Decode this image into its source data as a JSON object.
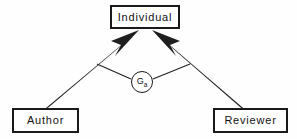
{
  "diagram": {
    "background_color": "#fefefe",
    "stroke_color": "#1a1a1a",
    "nodes": [
      {
        "id": "individual",
        "label": "Individual",
        "shape": "rectangle",
        "position": "top-center"
      },
      {
        "id": "author",
        "label": "Author",
        "shape": "rectangle",
        "position": "bottom-left"
      },
      {
        "id": "reviewer",
        "label": "Reviewer",
        "shape": "rectangle",
        "position": "bottom-right"
      }
    ],
    "edge_node": {
      "id": "ga",
      "label_base": "G",
      "label_subscript": "a",
      "shape": "circle",
      "position": "center"
    },
    "edges": [
      {
        "id": "author-to-individual",
        "from": "author",
        "to": "individual",
        "style": "thick-arrow",
        "arrowhead": "at-individual"
      },
      {
        "id": "reviewer-to-individual",
        "from": "reviewer",
        "to": "individual",
        "style": "thick-arrow",
        "arrowhead": "at-individual"
      },
      {
        "id": "ga-to-left-arrow",
        "from": "ga",
        "to": "author-to-individual",
        "style": "thin-line",
        "arrowhead": "none"
      },
      {
        "id": "ga-to-right-arrow",
        "from": "ga",
        "to": "reviewer-to-individual",
        "style": "thin-line",
        "arrowhead": "none"
      }
    ]
  }
}
